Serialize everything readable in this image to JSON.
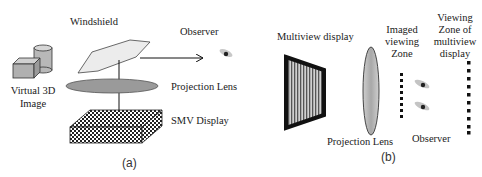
{
  "panel_a": {
    "caption": "(a)",
    "labels": {
      "windshield": "Windshield",
      "observer": "Observer",
      "projection_lens": "Projection Lens",
      "smv_display": "SMV Display",
      "virtual_image_line1": "Virtual 3D",
      "virtual_image_line2": "Image"
    }
  },
  "panel_b": {
    "caption": "(b)",
    "labels": {
      "multiview_display": "Multiview display",
      "projection_lens": "Projection Lens",
      "imaged_zone_line1": "Imaged",
      "imaged_zone_line2": "viewing",
      "imaged_zone_line3": "Zone",
      "viewing_zone_line1": "Viewing",
      "viewing_zone_line2": "Zone of",
      "viewing_zone_line3": "multiview",
      "viewing_zone_line4": "display",
      "observer": "Observer"
    }
  },
  "colors": {
    "lens_fill": "#9a9a9a",
    "windshield_fill": "#ececec",
    "box_fill": "#bdbdbd",
    "ink": "#111111"
  }
}
